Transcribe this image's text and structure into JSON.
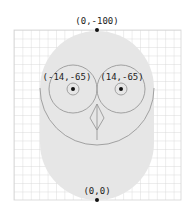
{
  "diagram": {
    "type": "owl-geometry-construction",
    "points": [
      {
        "label": "(0,-100)",
        "x": 0,
        "y": -100
      },
      {
        "label": "(-14,-65)",
        "x": -14,
        "y": -65
      },
      {
        "label": "(14,-65)",
        "x": 14,
        "y": -65
      },
      {
        "label": "(0,0)",
        "x": 0,
        "y": 0
      }
    ],
    "colors": {
      "body_fill": "#e6e6e6",
      "grid_line": "#d4d4d4",
      "stroke": "#999999",
      "point": "#111111"
    }
  }
}
